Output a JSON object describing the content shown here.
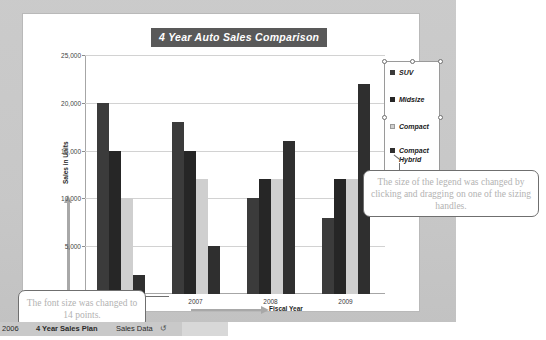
{
  "chart": {
    "title": "4 Year Auto Sales Comparison",
    "title_bg": "#595959",
    "title_color": "#ffffff"
  },
  "axes": {
    "y_title": "Sales in Units",
    "x_title": "Fiscal Year",
    "y_ticks": [
      "0",
      "5,000",
      "10,000",
      "15,000",
      "20,000",
      "25,000"
    ],
    "x_ticks": [
      "2006",
      "2007",
      "2008",
      "2009"
    ]
  },
  "legend": {
    "items": [
      {
        "label": "SUV",
        "color": "#3b3b3b",
        "swatch": "suv"
      },
      {
        "label": "Midsize",
        "color": "#262626",
        "swatch": "midsize"
      },
      {
        "label": "Compact",
        "color": "#cfcfcf",
        "swatch": "compact"
      },
      {
        "label": "Compact\nHybrid",
        "color": "#2f2f2f",
        "swatch": "hybrid"
      }
    ]
  },
  "callouts": {
    "legend_note": "The size of the legend was changed by clicking and dragging on one of the sizing handles.",
    "font_note": "The font size was changed to 14 points."
  },
  "tabbar": {
    "cell_ref": "2006",
    "tabs": [
      {
        "label": "4 Year Sales Plan",
        "active": true
      },
      {
        "label": "Sales Data",
        "active": false
      }
    ],
    "scroll_icon": "↺"
  },
  "chart_data": {
    "type": "bar",
    "title": "4 Year Auto Sales Comparison",
    "xlabel": "Fiscal Year",
    "ylabel": "Sales in Units",
    "categories": [
      "2006",
      "2007",
      "2008",
      "2009"
    ],
    "ylim": [
      0,
      25000
    ],
    "ytick_step": 5000,
    "grid": true,
    "legend_position": "right",
    "series": [
      {
        "name": "SUV",
        "color": "#3b3b3b",
        "values": [
          20000,
          18000,
          10000,
          8000
        ]
      },
      {
        "name": "Midsize",
        "color": "#262626",
        "values": [
          15000,
          15000,
          12000,
          12000
        ]
      },
      {
        "name": "Compact",
        "color": "#cfcfcf",
        "values": [
          10000,
          12000,
          12000,
          12000
        ]
      },
      {
        "name": "Compact Hybrid",
        "color": "#2f2f2f",
        "values": [
          2000,
          5000,
          16000,
          22000
        ]
      }
    ]
  }
}
